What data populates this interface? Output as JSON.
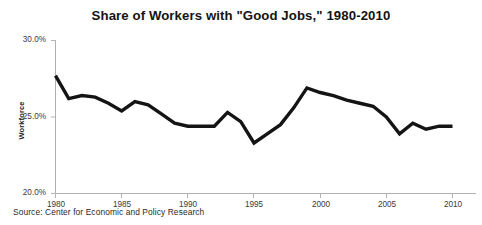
{
  "chart_data": {
    "type": "line",
    "title": "Share of Workers with \"Good Jobs,\" 1980-2010",
    "xlabel": "",
    "ylabel": "Workforce",
    "source": "Source: Center for Economic and Policy Research",
    "grid": false,
    "legend": "none",
    "xlim": [
      1980,
      2010
    ],
    "ylim": [
      20.0,
      30.0
    ],
    "ytick_labels": [
      "30.0%",
      "25.0%",
      "20.0%"
    ],
    "ytick_values": [
      30.0,
      25.0,
      20.0
    ],
    "xtick_labels": [
      "1980",
      "1985",
      "1990",
      "1995",
      "2000",
      "2005",
      "2010"
    ],
    "xtick_values": [
      1980,
      1985,
      1990,
      1995,
      2000,
      2005,
      2010
    ],
    "line_color": "#141414",
    "axis_color": "#b0b0b0",
    "x": [
      1980,
      1981,
      1982,
      1983,
      1984,
      1985,
      1986,
      1987,
      1988,
      1989,
      1990,
      1991,
      1992,
      1993,
      1994,
      1995,
      1996,
      1997,
      1998,
      1999,
      2000,
      2001,
      2002,
      2003,
      2004,
      2005,
      2006,
      2007,
      2008,
      2009,
      2010
    ],
    "values": [
      27.7,
      26.2,
      26.4,
      26.3,
      25.9,
      25.4,
      26.0,
      25.8,
      25.2,
      24.6,
      24.4,
      24.4,
      24.4,
      25.3,
      24.7,
      23.3,
      23.9,
      24.5,
      25.6,
      26.9,
      26.6,
      26.4,
      26.1,
      25.9,
      25.7,
      25.0,
      23.9,
      24.6,
      24.2,
      24.4,
      24.4
    ],
    "series_name": "Share of workers with good jobs"
  }
}
